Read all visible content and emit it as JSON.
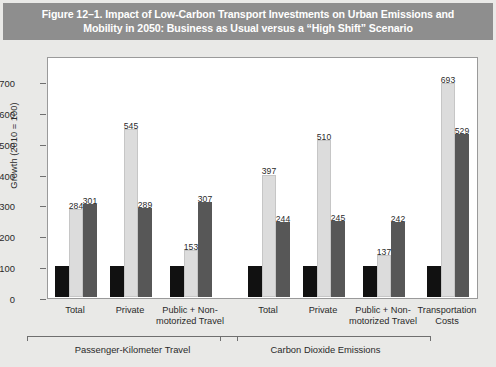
{
  "figure": {
    "title": "Figure 12–1. Impact of Low-Carbon Transport Investments on Urban Emissions and Mobility in 2050: Business as Usual versus a “High Shift” Scenario"
  },
  "colors": {
    "title_band": "#8e8e8e",
    "title_text": "#ffffff",
    "page_background": "#e9e9e7",
    "plot_background": "#ffffff",
    "series_2010": "#111111",
    "series_bau": "#dcdcdc",
    "series_shift": "#575757",
    "axis": "#6f6f6f"
  },
  "chart_data": {
    "type": "bar",
    "title": "Figure 12–1. Impact of Low-Carbon Transport Investments on Urban Emissions and Mobility in 2050: Business as Usual versus a “High Shift” Scenario",
    "xlabel": "",
    "ylabel": "Growth (2010 = 100)",
    "ylim": [
      0,
      700
    ],
    "yticks": [
      0,
      100,
      200,
      300,
      400,
      500,
      600,
      700
    ],
    "ytick_labels": [
      "0",
      "100",
      "200",
      "300",
      "400",
      "500",
      "600",
      "700"
    ],
    "grid": false,
    "legend_position": "top",
    "categories": [
      "Total",
      "Private",
      "Public + Non-motorized Travel",
      "Total",
      "Private",
      "Public + Non-motorized Travel",
      "Transportation Costs"
    ],
    "category_labels": [
      "Total",
      "Private",
      "Public + Non-\nmotorized Travel",
      "Total",
      "Private",
      "Public + Non-\nmotorized Travel",
      "Transportation\nCosts"
    ],
    "series": [
      {
        "name": "2010",
        "color": "#111111",
        "values": [
          100,
          100,
          100,
          100,
          100,
          100,
          100
        ],
        "labels": [
          "",
          "",
          "",
          "",
          "",
          "",
          ""
        ]
      },
      {
        "name": "2050 Business as Usual",
        "color": "#dcdcdc",
        "values": [
          284,
          545,
          153,
          397,
          510,
          137,
          693
        ],
        "labels": [
          "284",
          "545",
          "153",
          "397",
          "510",
          "137",
          "693"
        ]
      },
      {
        "name": "2050 High Avoid and Shift",
        "color": "#575757",
        "values": [
          301,
          289,
          307,
          244,
          245,
          242,
          529
        ],
        "labels": [
          "301",
          "289",
          "307",
          "244",
          "245",
          "242",
          "529"
        ]
      }
    ],
    "group_brackets": [
      {
        "label": "Passenger-Kilometer Travel",
        "categories": [
          0,
          1,
          2
        ]
      },
      {
        "label": "Carbon Dioxide Emissions",
        "categories": [
          3,
          4,
          5
        ]
      }
    ]
  }
}
